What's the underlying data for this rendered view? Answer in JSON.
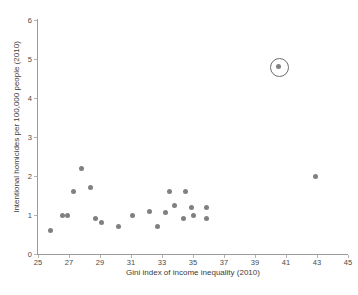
{
  "chart_data": {
    "type": "scatter",
    "title": "",
    "xlabel": "Gini index of income inequality (2010)",
    "ylabel": "Intentional homicides per 100,000 people (2010)",
    "xlim": [
      25,
      45
    ],
    "ylim": [
      0,
      6
    ],
    "xticks": [
      25,
      27,
      29,
      31,
      33,
      35,
      37,
      39,
      41,
      43,
      45
    ],
    "xtick_labels": [
      "25",
      "27",
      "29",
      "31",
      "33",
      "35",
      "37",
      "39",
      "41",
      "43",
      "45"
    ],
    "yticks": [
      0,
      1,
      2,
      3,
      4,
      5,
      6
    ],
    "ytick_labels": [
      "0",
      "1",
      "2",
      "3",
      "4",
      "5",
      "6"
    ],
    "grid": false,
    "legend": null,
    "marker_color": "#808080",
    "highlight_ring_color": "#6e6e6e",
    "axis_color": "#9a9a9a",
    "points": [
      {
        "x": 25.8,
        "y": 0.6,
        "highlighted": false
      },
      {
        "x": 26.6,
        "y": 1.0,
        "highlighted": false
      },
      {
        "x": 26.9,
        "y": 1.0,
        "highlighted": false
      },
      {
        "x": 27.3,
        "y": 1.6,
        "highlighted": false
      },
      {
        "x": 27.8,
        "y": 2.2,
        "highlighted": false
      },
      {
        "x": 28.4,
        "y": 1.7,
        "highlighted": false
      },
      {
        "x": 28.7,
        "y": 0.9,
        "highlighted": false
      },
      {
        "x": 29.1,
        "y": 0.8,
        "highlighted": false
      },
      {
        "x": 30.2,
        "y": 0.7,
        "highlighted": false
      },
      {
        "x": 31.1,
        "y": 1.0,
        "highlighted": false
      },
      {
        "x": 32.2,
        "y": 1.1,
        "highlighted": false
      },
      {
        "x": 32.7,
        "y": 0.7,
        "highlighted": false
      },
      {
        "x": 33.2,
        "y": 1.07,
        "highlighted": false
      },
      {
        "x": 33.5,
        "y": 1.6,
        "highlighted": false
      },
      {
        "x": 33.8,
        "y": 1.25,
        "highlighted": false
      },
      {
        "x": 34.5,
        "y": 1.6,
        "highlighted": false
      },
      {
        "x": 34.4,
        "y": 0.9,
        "highlighted": false
      },
      {
        "x": 34.9,
        "y": 1.18,
        "highlighted": false
      },
      {
        "x": 35.0,
        "y": 0.98,
        "highlighted": false
      },
      {
        "x": 35.9,
        "y": 1.18,
        "highlighted": false
      },
      {
        "x": 35.9,
        "y": 0.9,
        "highlighted": false
      },
      {
        "x": 40.5,
        "y": 4.8,
        "highlighted": true
      },
      {
        "x": 42.9,
        "y": 2.0,
        "highlighted": false
      }
    ]
  }
}
